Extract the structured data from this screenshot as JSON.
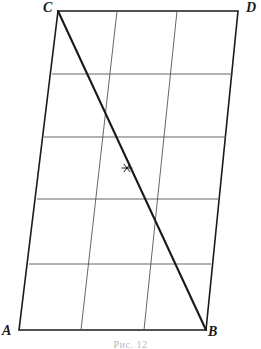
{
  "figure": {
    "caption": "Рис. 12",
    "background_color": "#ffffff",
    "ink_color": "#1a1a1a",
    "grid_color": "#555555",
    "labels": {
      "A": "A",
      "B": "B",
      "C": "C",
      "D": "D"
    },
    "vertices": {
      "A": {
        "x": 19,
        "y": 330
      },
      "B": {
        "x": 206,
        "y": 330
      },
      "C": {
        "x": 58,
        "y": 11
      },
      "D": {
        "x": 238,
        "y": 11
      }
    },
    "outline_path": "M 19 330 L 206 330 L 238 11 L 58 11 Z",
    "diagonal": {
      "name": "CB",
      "from": {
        "x": 58,
        "y": 11
      },
      "to": {
        "x": 206,
        "y": 330
      },
      "stroke_width": 2.1
    },
    "midpoint_marker": {
      "symbol": "asterisk",
      "x": 127,
      "y": 168,
      "size": 5
    },
    "horizontal_lines": [
      {
        "x1": 52,
        "y1": 74,
        "x2": 233,
        "y2": 74
      },
      {
        "x1": 44,
        "y1": 137,
        "x2": 226,
        "y2": 137
      },
      {
        "x1": 37,
        "y1": 199,
        "x2": 218,
        "y2": 199
      },
      {
        "x1": 29,
        "y1": 264,
        "x2": 211,
        "y2": 264
      }
    ],
    "vertical_lines": [
      {
        "x1": 117,
        "y1": 11,
        "x2": 81,
        "y2": 330
      },
      {
        "x1": 177,
        "y1": 11,
        "x2": 144,
        "y2": 330
      }
    ],
    "outline_stroke_width": 1.6,
    "grid_stroke_width": 0.9
  }
}
